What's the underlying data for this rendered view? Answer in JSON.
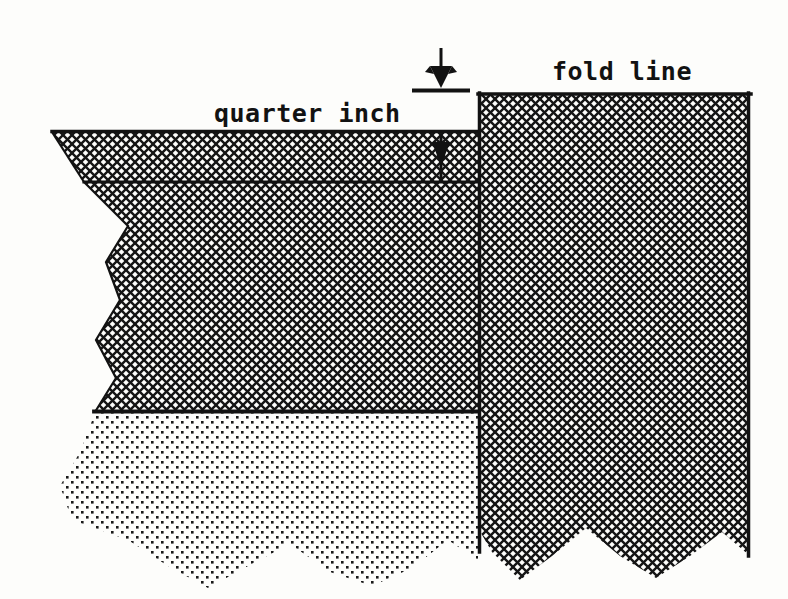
{
  "figure": {
    "background_color": "#fdfdfb",
    "ink_color": "#121212",
    "labels": {
      "quarter_inch": "quarter inch",
      "fold_line": "fold line"
    },
    "regions": [
      {
        "name": "hem-allowance-band",
        "fill": "crosshatch",
        "description": "narrow crosshatched band above the stitch line"
      },
      {
        "name": "folded-fabric-body",
        "fill": "crosshatch",
        "description": "large crosshatched body of folded fabric"
      },
      {
        "name": "under-fabric",
        "fill": "stipple",
        "description": "light stippled fabric layer below"
      },
      {
        "name": "fold-line-column",
        "fill": "crosshatch",
        "description": "vertical crosshatched column at the fold line"
      }
    ],
    "annotations": [
      {
        "name": "upper-dimension-arrow",
        "glyph": "arrow-down",
        "points_to": "fold edge top",
        "direction": "down"
      },
      {
        "name": "lower-dimension-arrow",
        "glyph": "arrow-down",
        "points_to": "stitch line",
        "direction": "down"
      }
    ],
    "edges": [
      {
        "name": "left-torn-edge",
        "style": "zigzag"
      },
      {
        "name": "bottom-torn-edge-stipple",
        "style": "wavy"
      },
      {
        "name": "bottom-torn-edge-column",
        "style": "wavy"
      }
    ],
    "lines": [
      {
        "name": "fold-edge-line",
        "orientation": "horizontal"
      },
      {
        "name": "stitch-line",
        "orientation": "horizontal"
      },
      {
        "name": "fabric-base-line",
        "orientation": "horizontal"
      },
      {
        "name": "column-left-edge-line",
        "orientation": "vertical"
      },
      {
        "name": "column-right-edge-line",
        "orientation": "vertical"
      }
    ]
  }
}
